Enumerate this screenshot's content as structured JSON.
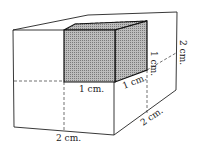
{
  "diagram": {
    "colors": {
      "stroke": "#222222",
      "shade": "#9a9a9a",
      "background": "#ffffff"
    },
    "labels": {
      "small_height": "1 cm.",
      "small_width": "1 cm.",
      "small_depth": "1 cm.",
      "big_height": "2 cm.",
      "big_width": "2 cm.",
      "big_depth": "2 cm."
    }
  }
}
